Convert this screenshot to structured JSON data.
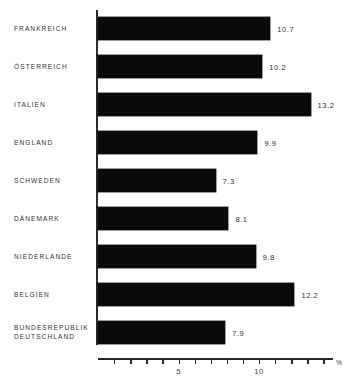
{
  "chart_data": {
    "type": "bar",
    "orientation": "horizontal",
    "title": "",
    "subtitle": "",
    "xlabel": "%",
    "ylabel": "",
    "categories": [
      "FRANKREICH",
      "ÖSTERREICH",
      "ITALIEN",
      "ENGLAND",
      "SCHWEDEN",
      "DÄNEMARK",
      "NIEDERLANDE",
      "BELGIEN",
      "BUNDESREPUBLIK\nDEUTSCHLAND"
    ],
    "values": [
      10.7,
      10.2,
      13.2,
      9.9,
      7.3,
      8.1,
      9.8,
      12.2,
      7.9
    ],
    "value_labels": [
      "10.7",
      "10.2",
      "13.2",
      "9.9",
      "7.3",
      "8.1",
      "9.8",
      "12.2",
      "7.9"
    ],
    "xlim": [
      0,
      14.6
    ],
    "xticks": [
      0,
      1,
      2,
      3,
      4,
      5,
      6,
      7,
      8,
      9,
      10,
      11,
      12,
      13,
      14
    ],
    "xtick_labels": [
      "",
      "",
      "",
      "",
      "",
      "5",
      "",
      "",
      "",
      "",
      "10",
      "",
      "",
      "",
      ""
    ],
    "labeled_xticks": [
      {
        "value": 5,
        "label": "5"
      },
      {
        "value": 10,
        "label": "10"
      }
    ],
    "unit_symbol": "%",
    "grid": false,
    "legend": null,
    "bar_color": "#0a0a0a",
    "axis_color": "#262626",
    "text_color": "#303030",
    "background_color": "#ffffff"
  }
}
